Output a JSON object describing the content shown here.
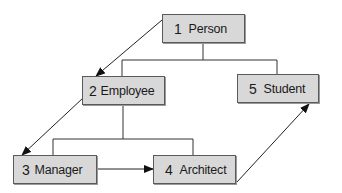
{
  "diagram": {
    "type": "class-hierarchy-with-traversal",
    "nodes": [
      {
        "id": "person",
        "number": "1",
        "label": "Person"
      },
      {
        "id": "employee",
        "number": "2",
        "label": "Employee"
      },
      {
        "id": "manager",
        "number": "3",
        "label": "Manager"
      },
      {
        "id": "architect",
        "number": "4",
        "label": "Architect"
      },
      {
        "id": "student",
        "number": "5",
        "label": "Student"
      }
    ],
    "hierarchy_edges": [
      {
        "parent": "person",
        "child": "employee"
      },
      {
        "parent": "person",
        "child": "student"
      },
      {
        "parent": "employee",
        "child": "manager"
      },
      {
        "parent": "employee",
        "child": "architect"
      }
    ],
    "traversal_arrows": [
      {
        "from": "person",
        "to": "employee"
      },
      {
        "from": "employee",
        "to": "manager"
      },
      {
        "from": "manager",
        "to": "architect"
      },
      {
        "from": "architect",
        "to": "student"
      }
    ],
    "colors": {
      "node_fill": "#d8d8d8",
      "node_border": "#5a5a5a",
      "line": "#333333"
    }
  }
}
